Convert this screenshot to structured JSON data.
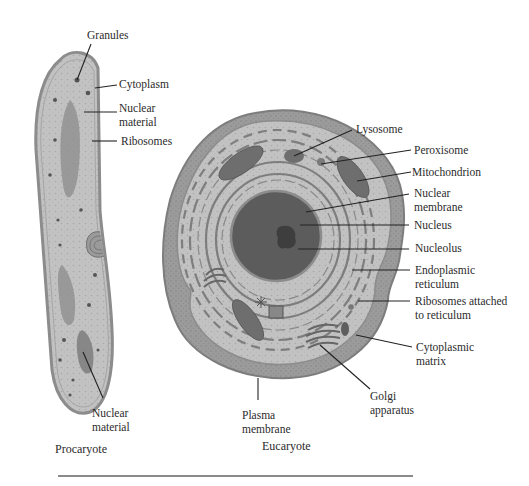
{
  "figure": {
    "procaryote": {
      "caption": "Procaryote",
      "labels": {
        "granules": "Granules",
        "cytoplasm": "Cytoplasm",
        "nuclear_material_top": "Nuclear\nmaterial",
        "ribosomes": "Ribosomes",
        "nuclear_material_bottom": "Nuclear\nmaterial"
      }
    },
    "eucaryote": {
      "caption": "Eucaryote",
      "labels": {
        "lysosome": "Lysosome",
        "peroxisome": "Peroxisome",
        "mitochondrion": "Mitochondrion",
        "nuclear_membrane": "Nuclear\nmembrane",
        "nucleus": "Nucleus",
        "nucleolus": "Nucleolus",
        "endoplasmic_reticulum": "Endoplasmic\nreticulum",
        "ribosomes_attached": "Ribosomes attached\nto reticulum",
        "cytoplasmic_matrix": "Cytoplasmic\nmatrix",
        "golgi_apparatus": "Golgi\napparatus",
        "plasma_membrane": "Plasma\nmembrane"
      }
    },
    "colors": {
      "membrane": "#8c8c8c",
      "cytoplasm": "#c4c4c4",
      "outer_cortex": "#9a9a9a",
      "organelle": "#6e6e6e",
      "nucleus": "#5a5a5a",
      "nucleolus": "#3e3e3e",
      "leader_line": "#222222"
    }
  }
}
